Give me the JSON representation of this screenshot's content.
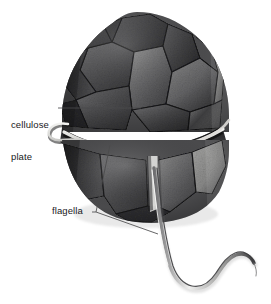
{
  "figure": {
    "background_color": "#ffffff",
    "width": 271,
    "height": 304
  },
  "labels": [
    {
      "id": "cellulose-plate",
      "line1": "cellulose",
      "line2": "plate",
      "text": "cellulose plate",
      "color": "#18181a",
      "leader": {
        "type": "line",
        "from": [
          58,
          108
        ],
        "to": [
          141,
          108
        ]
      }
    },
    {
      "id": "flagella",
      "text": "flagella",
      "color": "#18181a",
      "leader": {
        "type": "bracket",
        "tick": [
          [
            92,
            212
          ],
          [
            96,
            212
          ]
        ],
        "upper": [
          [
            96,
            212
          ],
          [
            110,
            145
          ]
        ],
        "lower": [
          [
            96,
            212
          ],
          [
            158,
            234
          ]
        ]
      }
    }
  ],
  "organism": {
    "name": "dinoflagellate",
    "parts": [
      {
        "name": "epitheca",
        "description": "upper half of cell covered in polygonal cellulose plates"
      },
      {
        "name": "cingulum",
        "description": "transverse girdle groove encircling the cell"
      },
      {
        "name": "hypotheca",
        "description": "lower half of cell covered in cellulose plates"
      },
      {
        "name": "transverse-flagellum",
        "description": "ribbon flagellum lying within the cingulum groove"
      },
      {
        "name": "longitudinal-flagellum",
        "description": "trailing flagellum emerging from the sulcus"
      }
    ],
    "colors": {
      "plate_dark": "#3a3a3c",
      "plate_mid": "#5a5a5c",
      "plate_light": "#8d8d8e",
      "plate_highlight": "#b8b8b6",
      "suture": "#1c1c1e",
      "flagellum_light": "#e8e8e6",
      "flagellum_dark": "#4a4a4c",
      "shadow": "#232325"
    }
  },
  "leader_line": {
    "color": "#4a4a4c",
    "width": 0.85
  }
}
